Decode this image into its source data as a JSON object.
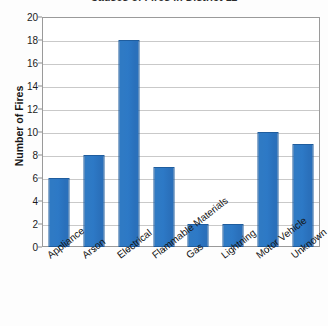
{
  "chart_data": {
    "type": "bar",
    "title": "Causes of Fires in District 12",
    "xlabel": "",
    "ylabel": "Number of Fires",
    "categories": [
      "Appliance",
      "Arson",
      "Electrical",
      "Flammable Materials",
      "Gas",
      "Lightning",
      "Motor Vehicle",
      "Unknown"
    ],
    "values": [
      6,
      8,
      18,
      7,
      2,
      2,
      10,
      9
    ],
    "ylim": [
      0,
      20
    ],
    "ytick_step": 2,
    "yticks": [
      20,
      18,
      16,
      14,
      12,
      10,
      8,
      6,
      4,
      2,
      0
    ],
    "grid": "horizontal",
    "legend": "none",
    "bar_color": "#2f7ac4",
    "bar_edge_color": "#1f5d9e",
    "gridline_color": "#c9c9c9",
    "plot_border_color": "#9a9a9a",
    "background_color": "#ffffff"
  }
}
